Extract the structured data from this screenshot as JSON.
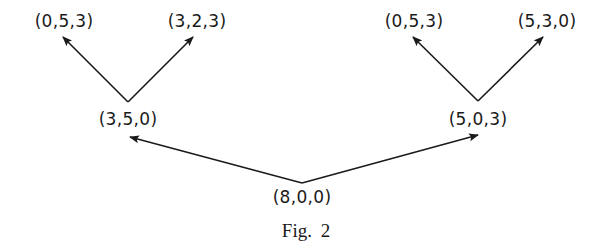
{
  "figure": {
    "caption": "Fig. 2",
    "nodes": {
      "root": {
        "label": "(8,0,0)",
        "x": 302,
        "y": 189
      },
      "left_mid": {
        "label": "(3,5,0)",
        "x": 128,
        "y": 111
      },
      "right_mid": {
        "label": "(5,0,3)",
        "x": 478,
        "y": 111
      },
      "left_left_leaf": {
        "label": "(0,5,3)",
        "x": 64,
        "y": 13
      },
      "left_right_leaf": {
        "label": "(3,2,3)",
        "x": 197,
        "y": 13
      },
      "right_left_leaf": {
        "label": "(0,5,3)",
        "x": 414,
        "y": 13
      },
      "right_right_leaf": {
        "label": "(5,3,0)",
        "x": 547,
        "y": 13
      }
    },
    "edges": [
      {
        "from": "root",
        "to": "left_mid",
        "x1": 302,
        "y1": 183,
        "x2": 130,
        "y2": 137
      },
      {
        "from": "root",
        "to": "right_mid",
        "x1": 302,
        "y1": 183,
        "x2": 478,
        "y2": 135
      },
      {
        "from": "left_mid",
        "to": "left_left_leaf",
        "x1": 128,
        "y1": 102,
        "x2": 63,
        "y2": 37
      },
      {
        "from": "left_mid",
        "to": "left_right_leaf",
        "x1": 128,
        "y1": 102,
        "x2": 193,
        "y2": 37
      },
      {
        "from": "right_mid",
        "to": "right_left_leaf",
        "x1": 478,
        "y1": 101,
        "x2": 413,
        "y2": 37
      },
      {
        "from": "right_mid",
        "to": "right_right_leaf",
        "x1": 478,
        "y1": 101,
        "x2": 543,
        "y2": 37
      }
    ],
    "colors": {
      "ink": "#1a1a1a",
      "background": "#ffffff"
    }
  }
}
